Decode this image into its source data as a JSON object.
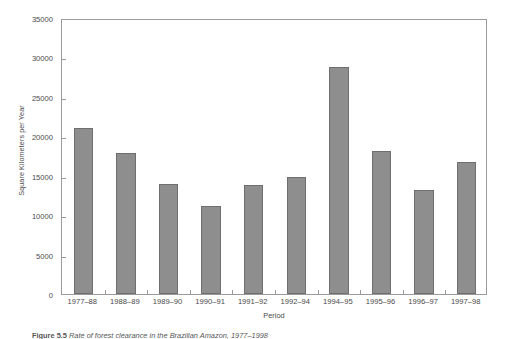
{
  "chart_data": {
    "type": "bar",
    "title": "",
    "xlabel": "Period",
    "ylabel": "Square Kilometers per Year",
    "categories": [
      "1977–88",
      "1988–89",
      "1989–90",
      "1990–91",
      "1991–92",
      "1992–94",
      "1994–95",
      "1995–96",
      "1996–97",
      "1997–98"
    ],
    "values": [
      21100,
      17900,
      13900,
      11100,
      13800,
      14900,
      28800,
      18100,
      13200,
      16700
    ],
    "ylim": [
      0,
      35000
    ],
    "yticks": [
      0,
      5000,
      10000,
      15000,
      20000,
      25000,
      30000,
      35000
    ],
    "ytick_labels": [
      "0",
      "5000",
      "10000",
      "15000",
      "20000",
      "25000",
      "30000",
      "35000"
    ],
    "grid": false,
    "legend": false,
    "legend_position": "none",
    "bar_color": "#8e8e8e",
    "bar_edge_color": "#6f6f6f",
    "axis_color": "#9a9a9a",
    "background_color": "#ffffff"
  },
  "caption": {
    "label": "Figure 5.5",
    "text": "Rate of forest clearance in the Brazilian Amazon, 1977–1998"
  }
}
